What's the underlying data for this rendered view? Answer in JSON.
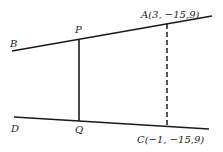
{
  "diagram": {
    "type": "geometry",
    "points": {
      "A": {
        "label": "A(3, −15,9)"
      },
      "B": {
        "label": "B"
      },
      "C": {
        "label": "C(−1, −15,9)"
      },
      "D": {
        "label": "D"
      },
      "P": {
        "label": "P"
      },
      "Q": {
        "label": "Q"
      }
    },
    "segments": [
      {
        "name": "line-BA",
        "style": "solid"
      },
      {
        "name": "line-DC",
        "style": "solid"
      },
      {
        "name": "segment-PQ",
        "style": "solid"
      },
      {
        "name": "segment-AC",
        "style": "dashed"
      }
    ],
    "colors": {
      "stroke": "#1a1a1a",
      "background": "#ffffff"
    }
  }
}
